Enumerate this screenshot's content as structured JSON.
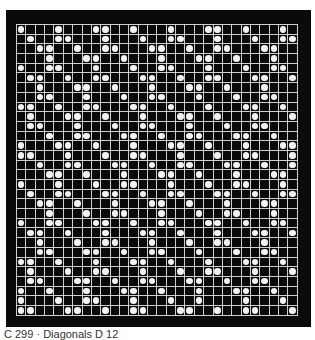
{
  "caption": "C 299 · Diagonals D 12",
  "grid": {
    "columns": 30,
    "rows": 30,
    "colors": {
      "background": "#0a0a0a",
      "lines": "#cfcfcf",
      "dot": "#f2f2f2"
    },
    "dots_by_row": [
      [
        1,
        5,
        9,
        10,
        13,
        17,
        21,
        22,
        25,
        29
      ],
      [
        2,
        5,
        6,
        10,
        14,
        17,
        18,
        22,
        26,
        29,
        30
      ],
      [
        3,
        4,
        7,
        10,
        11,
        15,
        16,
        19,
        22,
        23,
        27,
        28
      ],
      [
        4,
        8,
        9,
        12,
        16,
        20,
        21,
        24,
        28
      ],
      [
        1,
        4,
        5,
        9,
        13,
        16,
        17,
        21,
        25,
        28,
        29
      ],
      [
        2,
        3,
        6,
        9,
        10,
        14,
        15,
        18,
        21,
        22,
        26,
        27,
        30
      ],
      [
        3,
        7,
        8,
        11,
        15,
        19,
        20,
        23,
        27
      ],
      [
        3,
        4,
        8,
        12,
        15,
        16,
        20,
        24,
        27,
        28
      ],
      [
        1,
        2,
        5,
        8,
        9,
        13,
        14,
        17,
        21,
        25,
        26,
        29
      ],
      [
        2,
        6,
        7,
        10,
        14,
        18,
        19,
        22,
        26,
        30
      ],
      [
        2,
        3,
        7,
        11,
        14,
        15,
        19,
        23,
        26,
        27
      ],
      [
        4,
        7,
        8,
        12,
        13,
        16,
        19,
        20,
        24,
        25,
        28
      ],
      [
        1,
        5,
        6,
        9,
        13,
        17,
        18,
        21,
        25,
        29,
        30
      ],
      [
        1,
        2,
        6,
        10,
        13,
        14,
        18,
        22,
        25,
        26,
        30
      ],
      [
        3,
        6,
        7,
        11,
        12,
        15,
        18,
        19,
        23,
        24,
        27,
        30
      ],
      [
        4,
        5,
        8,
        12,
        16,
        17,
        20,
        24,
        28,
        29
      ],
      [
        1,
        5,
        9,
        12,
        13,
        17,
        21,
        24,
        25,
        29
      ],
      [
        2,
        5,
        6,
        10,
        11,
        14,
        17,
        18,
        22,
        23,
        26,
        29,
        30
      ],
      [
        3,
        4,
        7,
        11,
        15,
        16,
        19,
        23,
        27,
        28
      ],
      [
        4,
        8,
        11,
        12,
        16,
        20,
        23,
        24,
        28
      ],
      [
        1,
        4,
        5,
        9,
        10,
        13,
        16,
        17,
        21,
        22,
        25,
        28,
        29
      ],
      [
        2,
        3,
        6,
        10,
        14,
        15,
        18,
        22,
        26,
        27,
        30
      ],
      [
        3,
        7,
        10,
        11,
        15,
        19,
        22,
        23,
        27
      ],
      [
        3,
        4,
        8,
        9,
        12,
        15,
        16,
        20,
        24,
        27,
        28
      ],
      [
        1,
        2,
        5,
        9,
        13,
        14,
        17,
        21,
        25,
        26,
        29
      ],
      [
        2,
        6,
        9,
        10,
        14,
        18,
        21,
        22,
        26,
        30
      ],
      [
        2,
        3,
        7,
        8,
        11,
        14,
        15,
        19,
        20,
        23,
        26,
        27
      ],
      [
        1,
        4,
        8,
        12,
        13,
        16,
        20,
        24,
        25,
        28
      ],
      [
        1,
        5,
        8,
        9,
        13,
        17,
        20,
        25,
        29
      ],
      [
        1,
        2,
        6,
        7,
        10,
        13,
        14,
        18,
        19,
        22,
        25,
        26,
        30
      ]
    ]
  }
}
